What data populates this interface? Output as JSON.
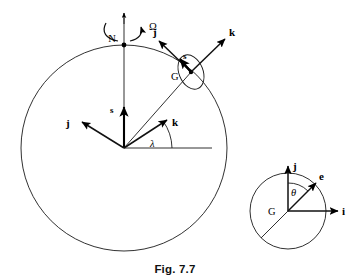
{
  "figure": {
    "caption": "Fig. 7.7",
    "background_color": "#ffffff",
    "ink_color": "#111111"
  },
  "earth_diagram": {
    "name": "earth-sphere-diagram",
    "circle": {
      "cx": 124,
      "cy": 148,
      "r": 103
    },
    "north_pole": {
      "label": "N",
      "marker": "dot",
      "x": 124,
      "y": 45
    },
    "spin_axis": {
      "label": "",
      "from_y": 13,
      "to_y": 148
    },
    "spin_arrow": {
      "label": "Ω",
      "label_x": 149,
      "label_y": 26,
      "description": "counterclockwise rotation arc about polar axis"
    },
    "center_frame": {
      "origin_label": "",
      "origin_x": 124,
      "origin_y": 148,
      "vectors": [
        {
          "label": "s",
          "dx": 0,
          "dy": -43,
          "label_x": 114,
          "label_y": 112
        },
        {
          "label": "j",
          "dx": -44,
          "dy": -26,
          "label_x": 69,
          "label_y": 124
        },
        {
          "label": "k",
          "dx": 45,
          "dy": -30,
          "label_x": 175,
          "label_y": 126
        }
      ],
      "horizontal_reference": {
        "x1": 124,
        "y1": 148,
        "x2": 212,
        "y2": 148
      },
      "angle": {
        "label": "λ",
        "label_x": 153,
        "label_y": 146,
        "value_degrees": 34
      }
    },
    "point_G": {
      "label": "G",
      "x": 190,
      "y": 73,
      "label_x": 176,
      "label_y": 80,
      "marker": "dot",
      "ellipse_note": "tilted ellipse (local body) drawn about G"
    },
    "G_frame_vectors": [
      {
        "label": "j",
        "tip_x": 156,
        "tip_y": 39,
        "label_x": 156,
        "label_y": 33
      },
      {
        "label": "k",
        "tip_x": 227,
        "tip_y": 36,
        "label_x": 231,
        "label_y": 34
      },
      {
        "label": "s",
        "tip_x": 178,
        "tip_y": 59,
        "label_x": 184,
        "label_y": 58
      }
    ],
    "radius_line": {
      "from": "center",
      "to": "G"
    }
  },
  "body_diagram": {
    "name": "body-detail-diagram",
    "circle": {
      "cx": 288,
      "cy": 211,
      "r": 38
    },
    "center_label": "G",
    "center_label_x": 272,
    "center_label_y": 215,
    "vectors": [
      {
        "label": "j",
        "dx": 0,
        "dy": -48,
        "label_x": 294,
        "label_y": 168
      },
      {
        "label": "i",
        "dx": 52,
        "dy": 0,
        "label_x": 344,
        "label_y": 215
      },
      {
        "label": "e",
        "dx": 31,
        "dy": -31,
        "label_x": 324,
        "label_y": 179
      }
    ],
    "angle": {
      "label": "θ",
      "label_x": 283,
      "label_y": 192,
      "value_degrees": 45
    },
    "diameter_line": {
      "description": "line through G opposite to e, reaching circle edge lower-left"
    }
  }
}
